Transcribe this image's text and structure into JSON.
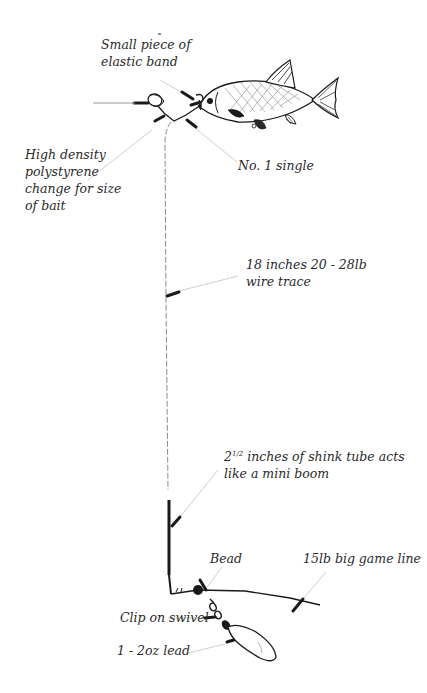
{
  "diagram": {
    "type": "fishing-rig-illustration",
    "colors": {
      "ink": "#1a1a1a",
      "text": "#2a2a2a",
      "leader": "#c8c8c8",
      "background": "#ffffff"
    },
    "labels": {
      "elastic_band": {
        "line1": "Small piece of",
        "line2": "elastic band"
      },
      "polystyrene": {
        "line1": "High density",
        "line2": "polystyrene",
        "line3": "change for size",
        "line4": "of bait"
      },
      "hook": {
        "text": "No. 1 single"
      },
      "wire_trace": {
        "line1": "18 inches 20 - 28lb",
        "line2": "wire trace"
      },
      "shrink_tube": {
        "number": "2",
        "fraction": "1/2",
        "line1_rest": " inches of shink tube acts",
        "line2": "like a mini boom"
      },
      "bead": {
        "text": "Bead"
      },
      "main_line": {
        "text": "15lb big game line"
      },
      "swivel": {
        "text": "Clip on swivel"
      },
      "lead": {
        "text": "1 - 2oz lead"
      }
    },
    "components": [
      "polystyrene-float",
      "elastic-band",
      "bait-fish",
      "single-hook",
      "wire-trace",
      "shrink-tube-boom",
      "bead",
      "clip-on-swivel",
      "lead-weight",
      "main-line"
    ]
  }
}
